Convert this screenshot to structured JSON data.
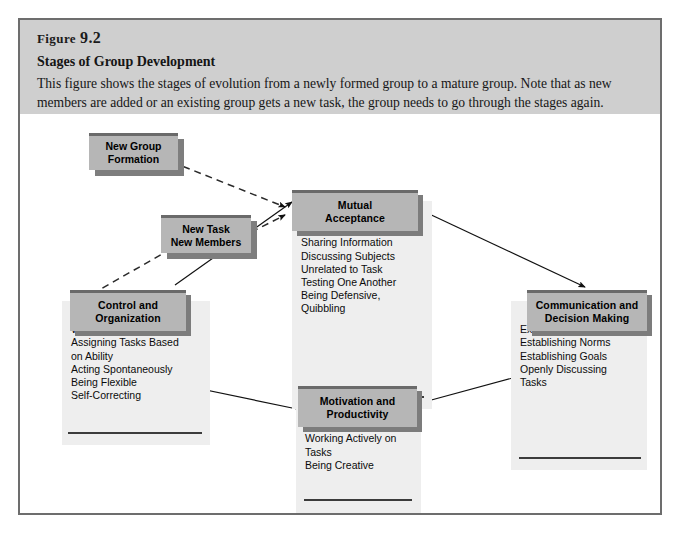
{
  "figure": {
    "label_word": "Figure",
    "label_number": "9.2",
    "subtitle": "Stages of Group Development",
    "description": "This figure shows the stages of evolution from a newly formed group to a mature group. Note that as new members are added or an existing group gets a new task, the group needs to go through the stages again."
  },
  "colors": {
    "frame_border": "#6d6d6d",
    "header_band": "#cfcfcf",
    "box_header": "#b6b6b6",
    "box_body": "#eeeeee",
    "box_shadow": "#7c7c7c",
    "rule": "#3b3b3b",
    "arrow": "#111111"
  },
  "inputs": [
    {
      "id": "new-group-formation",
      "title_line1": "New Group",
      "title_line2": "Formation"
    },
    {
      "id": "new-task-new-members",
      "title_line1": "New Task",
      "title_line2": "New Members"
    }
  ],
  "stages": [
    {
      "id": "mutual-acceptance",
      "title_line1": "Mutual",
      "title_line2": "Acceptance",
      "items": "Making Acquaintances\nSharing Information\nDiscussing Subjects\n  Unrelated to Task\nTesting One Another\nBeing Defensive,\n  Quibbling"
    },
    {
      "id": "communication-and-decision-making",
      "title_line1": "Communication and",
      "title_line2": "Decision Making",
      "items": "Expressing Attitudes\nEstablishing Norms\nEstablishing Goals\nOpenly Discussing\n  Tasks"
    },
    {
      "id": "motivation-and-productivity",
      "title_line1": "Motivation and",
      "title_line2": "Productivity",
      "items": "Cooperating\nWorking Actively on\n  Tasks\nBeing Creative"
    },
    {
      "id": "control-and-organization",
      "title_line1": "Control and",
      "title_line2": "Organization",
      "items": "Working Interdependently\nAssigning Tasks Based\n  on Ability\nActing Spontaneously\nBeing Flexible\nSelf-Correcting"
    }
  ],
  "connections": [
    {
      "from": "new-group-formation",
      "to": "mutual-acceptance",
      "style": "dashed",
      "arrow": true
    },
    {
      "from": "new-task-new-members",
      "to": "mutual-acceptance",
      "style": "dashed",
      "arrow": true
    },
    {
      "from": "control-and-organization",
      "to": "new-task-new-members",
      "style": "dashed",
      "arrow": false
    },
    {
      "from": "mutual-acceptance",
      "to": "communication-and-decision-making",
      "style": "solid",
      "arrow": true
    },
    {
      "from": "communication-and-decision-making",
      "to": "motivation-and-productivity",
      "style": "solid",
      "arrow": true
    },
    {
      "from": "motivation-and-productivity",
      "to": "control-and-organization",
      "style": "solid",
      "arrow": true
    },
    {
      "from": "control-and-organization",
      "to": "mutual-acceptance",
      "style": "solid",
      "arrow": true
    }
  ]
}
